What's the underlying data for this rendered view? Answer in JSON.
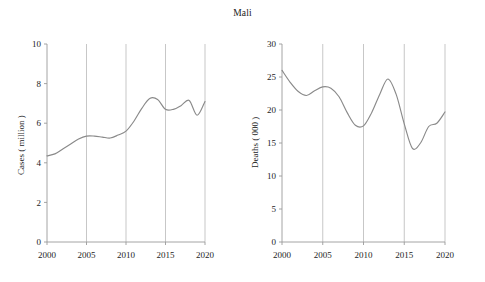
{
  "chart_title": "Mali",
  "axis_label_left": "Cases ( million )",
  "axis_label_right": "Deaths ( 000 )",
  "colors": {
    "line": "#8a8a8a",
    "grid": "#b9b9b9",
    "axis": "#9a9a9a",
    "text": "#1d1d1d",
    "background": "#ffffff"
  },
  "chart_data": [
    {
      "type": "line",
      "title": "Mali",
      "panel": "left",
      "xlabel": "",
      "ylabel": "Cases ( million )",
      "xlim": [
        2000,
        2020
      ],
      "ylim": [
        0,
        10
      ],
      "yticks": [
        0,
        2,
        4,
        6,
        8,
        10
      ],
      "xticks": [
        2000,
        2005,
        2010,
        2015,
        2020
      ],
      "xticklabels": [
        "2000",
        "2005",
        "2010",
        "2015",
        "2020"
      ],
      "yticklabels": [
        "0",
        "2",
        "4",
        "6",
        "8",
        "10"
      ],
      "grid": "vertical",
      "legend": "none",
      "x": [
        2000,
        2001,
        2002,
        2003,
        2004,
        2005,
        2006,
        2007,
        2008,
        2009,
        2010,
        2011,
        2012,
        2013,
        2014,
        2015,
        2016,
        2017,
        2018,
        2019,
        2020
      ],
      "values": [
        4.35,
        4.45,
        4.7,
        4.95,
        5.2,
        5.35,
        5.35,
        5.3,
        5.25,
        5.4,
        5.6,
        6.1,
        6.75,
        7.25,
        7.2,
        6.7,
        6.7,
        6.9,
        7.15,
        6.4,
        7.1
      ]
    },
    {
      "type": "line",
      "title": "Mali",
      "panel": "right",
      "xlabel": "",
      "ylabel": "Deaths ( 000 )",
      "xlim": [
        2000,
        2020
      ],
      "ylim": [
        0,
        30
      ],
      "yticks": [
        0,
        5,
        10,
        15,
        20,
        25,
        30
      ],
      "xticks": [
        2000,
        2005,
        2010,
        2015,
        2020
      ],
      "xticklabels": [
        "2000",
        "2005",
        "2010",
        "2015",
        "2020"
      ],
      "yticklabels": [
        "0",
        "5",
        "10",
        "15",
        "20",
        "25",
        "30"
      ],
      "grid": "vertical",
      "legend": "none",
      "x": [
        2000,
        2001,
        2002,
        2003,
        2004,
        2005,
        2006,
        2007,
        2008,
        2009,
        2010,
        2011,
        2012,
        2013,
        2014,
        2015,
        2016,
        2017,
        2018,
        2019,
        2020
      ],
      "values": [
        26.0,
        24.2,
        22.8,
        22.2,
        22.9,
        23.5,
        23.3,
        22.0,
        19.6,
        17.7,
        17.6,
        19.6,
        22.4,
        24.7,
        22.4,
        17.9,
        14.2,
        15.0,
        17.5,
        18.0,
        19.7
      ]
    }
  ]
}
